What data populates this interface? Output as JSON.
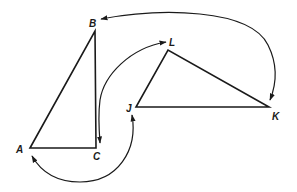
{
  "diagram": {
    "triangles": [
      {
        "name": "ABC",
        "vertices": {
          "A": {
            "label": "A",
            "x": 30,
            "y": 148
          },
          "B": {
            "label": "B",
            "x": 95,
            "y": 31
          },
          "C": {
            "label": "C",
            "x": 96,
            "y": 148
          }
        }
      },
      {
        "name": "JKL",
        "vertices": {
          "J": {
            "label": "J",
            "x": 136,
            "y": 107
          },
          "K": {
            "label": "K",
            "x": 269,
            "y": 107
          },
          "L": {
            "label": "L",
            "x": 168,
            "y": 50
          }
        }
      }
    ],
    "correspondences": [
      {
        "from": "K",
        "to": "B",
        "description": "arc from near K over the top to B"
      },
      {
        "from": "B",
        "to": "K",
        "description": "double-headed arc between B and K"
      },
      {
        "from": "L",
        "to": "C",
        "description": "double-headed arc between L and C"
      },
      {
        "from": "J",
        "to": "A",
        "description": "double-headed arc between J and A"
      }
    ],
    "labels": {
      "A": "A",
      "B": "B",
      "C": "C",
      "J": "J",
      "K": "K",
      "L": "L"
    }
  }
}
